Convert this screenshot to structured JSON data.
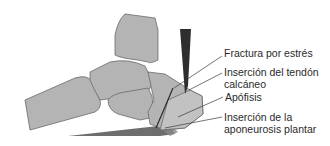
{
  "labels": {
    "stress_fracture": "Fractura por estrés",
    "tendon_insertion_line1": "Inserción del tendón",
    "tendon_insertion_line2": "calcáneo",
    "apophysis": "Apófisis",
    "plantar_insertion_line1": "Inserción de la",
    "plantar_insertion_line2": "aponeurosis plantar"
  },
  "colors": {
    "bone": "#b4b4b4",
    "tendon": "#2e2e2e",
    "fascia": "#555555",
    "text": "#2a2a2a"
  }
}
